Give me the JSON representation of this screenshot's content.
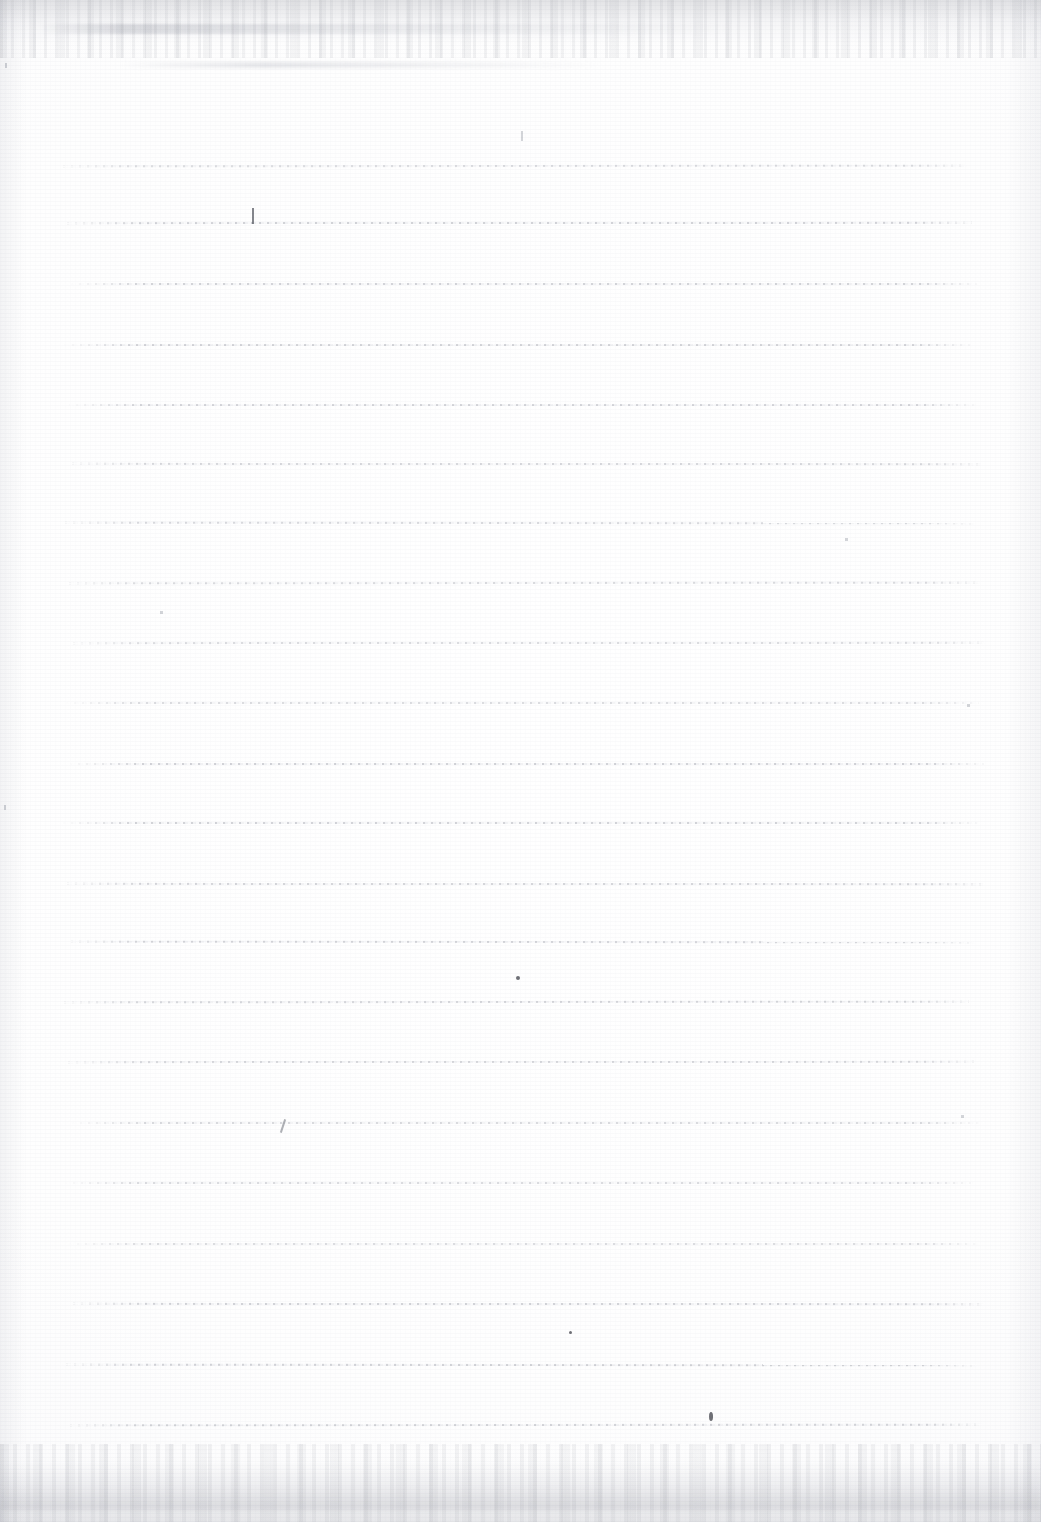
{
  "document": {
    "kind": "scanned-ruled-notebook-page",
    "title": "",
    "body_text": "",
    "visible_text_content": [],
    "page_width": 1041,
    "page_height": 1522,
    "paper_color": "#fdfdfd",
    "rule_color": "#b0b2ba",
    "edge_shadow_color": "#cdced2"
  },
  "ruling": {
    "line_count": 22,
    "line_left_x": 68,
    "line_right_x": 978,
    "line_spacing_px": 60,
    "first_line_y": 165,
    "last_line_y": 1424,
    "line_thickness_px": 2,
    "lines_y": [
      165,
      222,
      283,
      344,
      404,
      463,
      522,
      582,
      642,
      702,
      763,
      822,
      883,
      941,
      1001,
      1061,
      1122,
      1182,
      1243,
      1303,
      1364,
      1424
    ]
  },
  "artifacts": {
    "description": "faint pencil specks, scanner noise bands and paper grain",
    "marks": [
      {
        "name": "pencil-tick-upper-left",
        "x": 252,
        "y": 208,
        "w": 2,
        "h": 16,
        "kind": "tick"
      },
      {
        "name": "pencil-speck-top-center",
        "x": 521,
        "y": 131,
        "w": 2,
        "h": 10,
        "kind": "faint"
      },
      {
        "name": "pencil-speck-mid",
        "x": 516,
        "y": 976,
        "w": 4,
        "h": 4,
        "kind": "speck"
      },
      {
        "name": "pencil-stroke-lower-left",
        "x": 282,
        "y": 1119,
        "w": 2,
        "h": 14,
        "kind": "stroke"
      },
      {
        "name": "pencil-speck-bottom",
        "x": 569,
        "y": 1331,
        "w": 3,
        "h": 3,
        "kind": "speck"
      },
      {
        "name": "ink-smudge-last-line",
        "x": 709,
        "y": 1412,
        "w": 4,
        "h": 9,
        "kind": "speck"
      },
      {
        "name": "speck-left-edge-upper",
        "x": 5,
        "y": 63,
        "w": 2,
        "h": 5,
        "kind": "faint"
      },
      {
        "name": "speck-left-edge-lower",
        "x": 4,
        "y": 805,
        "w": 2,
        "h": 5,
        "kind": "faint"
      },
      {
        "name": "speck-right-edge",
        "x": 967,
        "y": 704,
        "w": 3,
        "h": 3,
        "kind": "faint"
      },
      {
        "name": "speck-upper-right-rule",
        "x": 845,
        "y": 538,
        "w": 3,
        "h": 3,
        "kind": "faint"
      },
      {
        "name": "speck-left-mid",
        "x": 160,
        "y": 611,
        "w": 3,
        "h": 3,
        "kind": "faint"
      },
      {
        "name": "speck-lower-right",
        "x": 961,
        "y": 1115,
        "w": 3,
        "h": 3,
        "kind": "faint"
      }
    ]
  }
}
